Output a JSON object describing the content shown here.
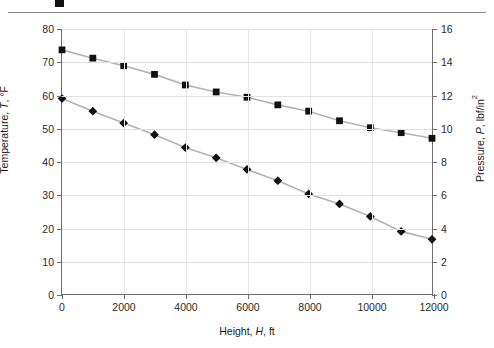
{
  "chart_data": {
    "type": "line",
    "title": "",
    "xlabel": "Height, H, ft",
    "xlabel_prefix": "Height, ",
    "xlabel_var": "H",
    "xlabel_suffix": ", ft",
    "ylabel_left_prefix": "Temperature, ",
    "ylabel_left_var": "T",
    "ylabel_left_suffix": ", °F",
    "ylabel_right_prefix": "Pressure, ",
    "ylabel_right_var": "P",
    "ylabel_right_suffix": ", lbf/in",
    "ylabel_right_exp": "2",
    "x": [
      0,
      1000,
      2000,
      3000,
      4000,
      5000,
      6000,
      7000,
      8000,
      9000,
      10000,
      11000,
      12000
    ],
    "xlim": [
      0,
      12000
    ],
    "xticks": [
      0,
      2000,
      4000,
      6000,
      8000,
      10000,
      12000
    ],
    "xticklabels": [
      "0",
      "2000",
      "4000",
      "6000",
      "8000",
      "10000",
      "12000"
    ],
    "ylim_left": [
      0,
      80
    ],
    "yticks_left": [
      0,
      10,
      20,
      30,
      40,
      50,
      60,
      70,
      80
    ],
    "yticklabels_left": [
      "0",
      "10",
      "20",
      "30",
      "40",
      "50",
      "60",
      "70",
      "80"
    ],
    "ylim_right": [
      0,
      16
    ],
    "yticks_right": [
      0,
      2,
      4,
      6,
      8,
      10,
      12,
      14,
      16
    ],
    "yticklabels_right": [
      "0",
      "2",
      "4",
      "6",
      "8",
      "10",
      "12",
      "14",
      "16"
    ],
    "grid": true,
    "legend": false,
    "series": [
      {
        "name": "Temperature",
        "axis": "left",
        "marker": "square",
        "color": "#111111",
        "line_color": "#b3b3b3",
        "values": [
          73.7,
          71.2,
          68.9,
          66.3,
          63.1,
          61.0,
          59.4,
          57.1,
          55.2,
          52.3,
          50.2,
          48.7,
          47.0
        ]
      },
      {
        "name": "Pressure",
        "axis": "right",
        "marker": "diamond",
        "color": "#111111",
        "line_color": "#b3b3b3",
        "values_on_left_scale": [
          59.0,
          55.2,
          51.6,
          48.1,
          44.2,
          41.1,
          37.6,
          34.2,
          30.2,
          27.2,
          23.4,
          18.9,
          16.5
        ],
        "values": [
          11.8,
          11.04,
          10.32,
          9.62,
          8.84,
          8.22,
          7.52,
          6.84,
          6.04,
          5.44,
          4.68,
          3.78,
          3.3
        ]
      }
    ]
  }
}
